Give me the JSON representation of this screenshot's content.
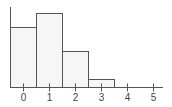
{
  "chart_data": {
    "type": "bar",
    "title": "",
    "xlabel": "",
    "ylabel": "",
    "categories": [
      "0",
      "1",
      "2",
      "3",
      "4",
      "5"
    ],
    "values": [
      0.3,
      0.37,
      0.18,
      0.04,
      0,
      0
    ],
    "relative_heights_px": [
      59,
      74,
      37,
      8,
      0,
      0
    ],
    "bar_style": "histogram, adjacent bars, light fill with dark outline",
    "x_ticks": [
      "0",
      "1",
      "2",
      "3",
      "4",
      "5"
    ],
    "y_ticks": [],
    "grid": false,
    "legend": null
  },
  "colors": {
    "bar_fill": "#f6f6f6",
    "bar_stroke": "#555555",
    "axis": "#555555",
    "text": "#444444"
  }
}
